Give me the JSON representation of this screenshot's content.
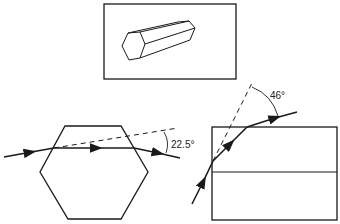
{
  "figure": {
    "top_panel": {
      "description": "hexagonal ice prism crystal"
    },
    "left_panel": {
      "angle_label": "22.5°",
      "shape": "hexagon cross-section"
    },
    "right_panel": {
      "angle_label": "46°",
      "shape": "prism side view"
    }
  },
  "colors": {
    "line": "#1a1a1a",
    "background": "#ffffff"
  }
}
